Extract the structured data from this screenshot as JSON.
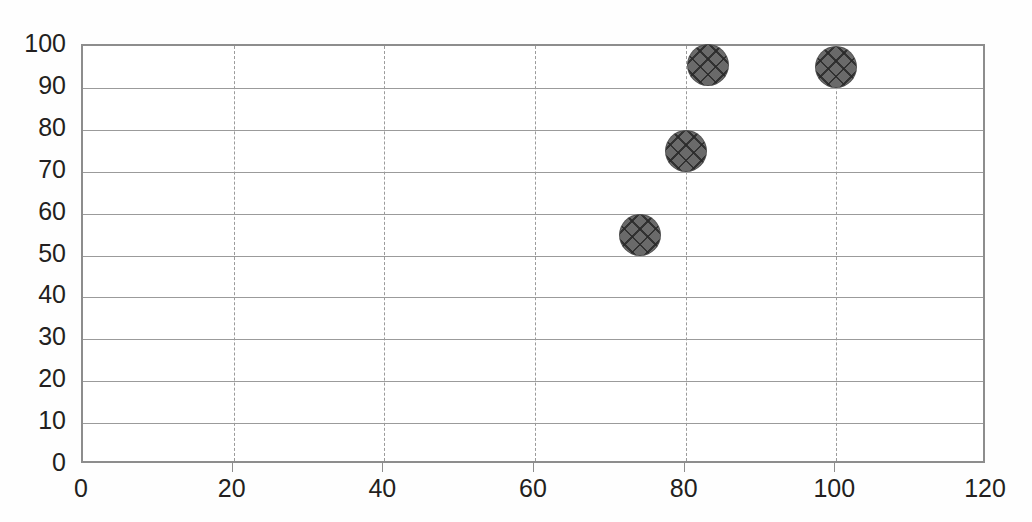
{
  "chart_data": {
    "type": "scatter",
    "title": "",
    "subtitle": "",
    "xlabel": "",
    "ylabel": "",
    "xlim": [
      0,
      120
    ],
    "ylim": [
      0,
      100
    ],
    "xticks": [
      0,
      20,
      40,
      60,
      80,
      100,
      120
    ],
    "yticks": [
      0,
      10,
      20,
      30,
      40,
      50,
      60,
      70,
      80,
      90,
      100
    ],
    "grid": {
      "horizontal": "solid",
      "vertical": "dashed",
      "color": "#9b9b9b"
    },
    "legend": null,
    "series": [
      {
        "name": "",
        "marker": {
          "shape": "circle",
          "fill_color": "#6a6a6a",
          "hatch": "cross-diagonal",
          "size_px": 42
        },
        "points": [
          {
            "x": 74,
            "y": 55
          },
          {
            "x": 80,
            "y": 75
          },
          {
            "x": 83,
            "y": 95.5
          },
          {
            "x": 100,
            "y": 95
          }
        ]
      }
    ]
  },
  "axes": {
    "plot_border_color": "#8d8d8d",
    "background": "#ffffff"
  }
}
